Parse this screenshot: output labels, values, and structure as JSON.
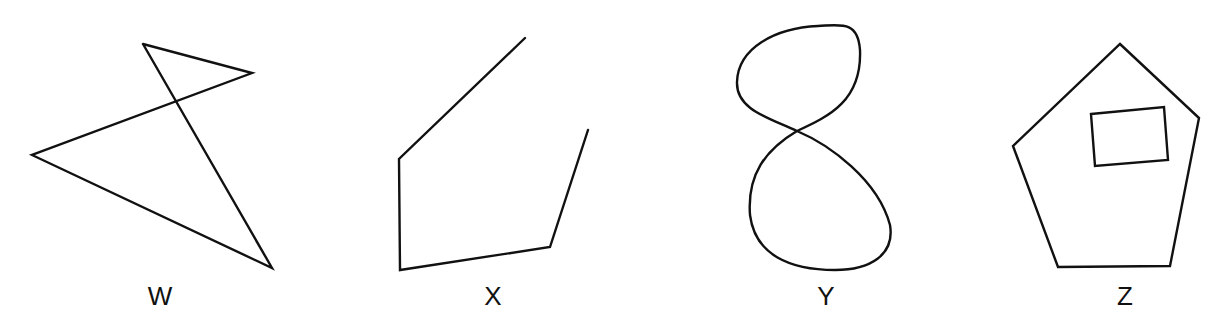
{
  "figures": [
    {
      "id": "W",
      "label": "W",
      "description": "self-intersecting open polyline (zigzag)",
      "label_x": 160
    },
    {
      "id": "X",
      "label": "X",
      "description": "open polyline, five vertices",
      "label_x": 493
    },
    {
      "id": "Y",
      "label": "Y",
      "description": "figure-eight closed curve crossing itself",
      "label_x": 826
    },
    {
      "id": "Z",
      "label": "Z",
      "description": "pentagon containing an inner rectangle",
      "label_x": 1125
    }
  ],
  "colors": {
    "stroke": "#111111",
    "background": "#ffffff"
  }
}
